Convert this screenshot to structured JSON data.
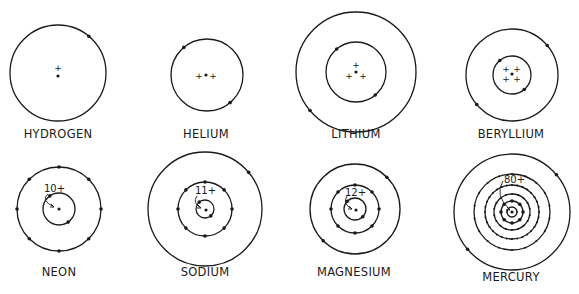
{
  "colors": {
    "ink": "#1a1a1a",
    "background": "#ffffff"
  },
  "atoms": [
    {
      "name": "HYDROGEN",
      "nucleus_charge": 1,
      "charge_label": null,
      "center": [
        58,
        73
      ],
      "label_pos": [
        58,
        138
      ],
      "shells": [
        {
          "radius": 48,
          "electrons": 1,
          "start_angle_deg": -50
        }
      ],
      "nucleus_plus": [
        [
          58,
          68
        ]
      ],
      "nucleus_dot": [
        58,
        76
      ]
    },
    {
      "name": "HELIUM",
      "nucleus_charge": 2,
      "charge_label": null,
      "center": [
        207,
        75
      ],
      "label_pos": [
        206,
        138
      ],
      "shells": [
        {
          "radius": 36,
          "electrons": 2,
          "start_angle_deg": -130
        }
      ],
      "nucleus_plus": [
        [
          199,
          76
        ],
        [
          213,
          76
        ]
      ],
      "nucleus_dot": [
        206,
        75
      ]
    },
    {
      "name": "LITHIUM",
      "nucleus_charge": 3,
      "charge_label": null,
      "center": [
        356,
        72
      ],
      "label_pos": [
        356,
        138
      ],
      "shells": [
        {
          "radius": 30,
          "electrons": 2,
          "start_angle_deg": -130
        },
        {
          "radius": 60,
          "electrons": 1,
          "start_angle_deg": 140
        }
      ],
      "nucleus_plus": [
        [
          356,
          65
        ],
        [
          349,
          76
        ],
        [
          363,
          76
        ]
      ],
      "nucleus_dot": [
        356,
        72
      ]
    },
    {
      "name": "BERYLLIUM",
      "nucleus_charge": 4,
      "charge_label": null,
      "center": [
        512,
        75
      ],
      "label_pos": [
        511,
        138
      ],
      "shells": [
        {
          "radius": 19,
          "electrons": 2,
          "start_angle_deg": -130
        },
        {
          "radius": 46,
          "electrons": 2,
          "start_angle_deg": -40
        }
      ],
      "nucleus_plus": [
        [
          506,
          69
        ],
        [
          517,
          69
        ],
        [
          506,
          79
        ],
        [
          517,
          79
        ]
      ],
      "nucleus_dot": [
        512,
        74
      ]
    },
    {
      "name": "NEON",
      "nucleus_charge": 10,
      "charge_label": "10+",
      "center": [
        59,
        209
      ],
      "label_pos": [
        59,
        276
      ],
      "shells": [
        {
          "radius": 16,
          "electrons": 2,
          "start_angle_deg": 55
        },
        {
          "radius": 42,
          "electrons": 8,
          "start_angle_deg": -90
        }
      ],
      "nucleus_plus": [],
      "nucleus_dot": [
        59,
        209
      ],
      "charge_text_pos": [
        44,
        192
      ],
      "arrow_path": "M48,194 Q40,200 54,207"
    },
    {
      "name": "SODIUM",
      "nucleus_charge": 11,
      "charge_label": "11+",
      "center": [
        205,
        209
      ],
      "label_pos": [
        205,
        276
      ],
      "shells": [
        {
          "radius": 9,
          "electrons": 2,
          "start_angle_deg": 50
        },
        {
          "radius": 27,
          "electrons": 8,
          "start_angle_deg": -90
        },
        {
          "radius": 57,
          "electrons": 1,
          "start_angle_deg": -40
        }
      ],
      "nucleus_plus": [],
      "nucleus_dot": [
        206,
        210
      ],
      "charge_text_pos": [
        195,
        194
      ],
      "arrow_path": "M197,196 Q192,203 201,208"
    },
    {
      "name": "MAGNESIUM",
      "nucleus_charge": 12,
      "charge_label": "12+",
      "center": [
        355,
        209
      ],
      "label_pos": [
        354,
        276
      ],
      "shells": [
        {
          "radius": 11,
          "electrons": 2,
          "start_angle_deg": -135
        },
        {
          "radius": 24,
          "electrons": 8,
          "start_angle_deg": -90
        },
        {
          "radius": 45,
          "electrons": 2,
          "start_angle_deg": -45
        }
      ],
      "nucleus_plus": [],
      "nucleus_dot": [
        356,
        210
      ],
      "charge_text_pos": [
        345,
        196
      ],
      "arrow_path": "M347,196 Q342,204 352,209"
    },
    {
      "name": "MERCURY",
      "nucleus_charge": 80,
      "charge_label": "80+",
      "center": [
        512,
        212
      ],
      "label_pos": [
        511,
        281
      ],
      "shells": [
        {
          "radius": 5,
          "electrons": 2,
          "start_angle_deg": 0
        },
        {
          "radius": 11,
          "electrons": 8,
          "start_angle_deg": -90
        },
        {
          "radius": 18,
          "electrons": 18,
          "start_angle_deg": -90
        },
        {
          "radius": 27,
          "electrons": 32,
          "start_angle_deg": -90
        },
        {
          "radius": 38,
          "electrons": 18,
          "start_angle_deg": -90
        },
        {
          "radius": 58,
          "electrons": 2,
          "start_angle_deg": -40
        }
      ],
      "nucleus_plus": [],
      "nucleus_dot": [
        512,
        212
      ],
      "charge_text_pos": [
        504,
        183
      ],
      "arrow_path": "M503,181 Q494,195 510,210"
    }
  ]
}
